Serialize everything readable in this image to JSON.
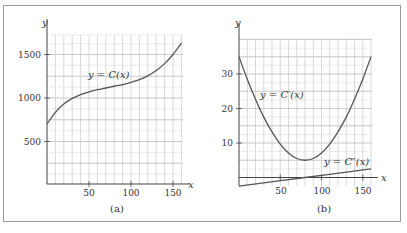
{
  "chart_data": [
    {
      "panel": "(a)",
      "type": "line",
      "title": "",
      "xlabel": "x",
      "ylabel": "y",
      "xlim": [
        0,
        162
      ],
      "ylim": [
        0,
        1750
      ],
      "xticks": [
        50,
        100,
        150
      ],
      "yticks": [
        500,
        1000,
        1500
      ],
      "grid": true,
      "series": [
        {
          "name": "y = C(x)",
          "x": [
            0,
            10,
            20,
            30,
            40,
            50,
            60,
            70,
            80,
            90,
            100,
            110,
            120,
            130,
            140,
            150,
            160
          ],
          "values": [
            700,
            835,
            930,
            995,
            1040,
            1070,
            1095,
            1115,
            1135,
            1155,
            1180,
            1210,
            1255,
            1315,
            1395,
            1500,
            1630
          ]
        }
      ],
      "annotations": [
        {
          "text": "y = C(x)",
          "x": 60,
          "y": 1250
        }
      ]
    },
    {
      "panel": "(b)",
      "type": "line",
      "title": "",
      "xlabel": "x",
      "ylabel": "y",
      "xlim": [
        0,
        162
      ],
      "ylim": [
        -3,
        40
      ],
      "xticks": [
        50,
        100,
        150
      ],
      "yticks": [
        10,
        20,
        30
      ],
      "grid": true,
      "series": [
        {
          "name": "y = C′(x)",
          "x": [
            0,
            10,
            20,
            30,
            40,
            50,
            60,
            70,
            80,
            90,
            100,
            110,
            120,
            130,
            140,
            150,
            160
          ],
          "values": [
            35,
            28.5,
            22.7,
            17.5,
            13.2,
            9.7,
            7.1,
            5.5,
            5.0,
            5.5,
            7.1,
            9.7,
            13.2,
            17.5,
            22.7,
            28.5,
            35
          ]
        },
        {
          "name": "y = C″(x)",
          "x": [
            0,
            80,
            160
          ],
          "values": [
            -2.5,
            0,
            2.5
          ]
        }
      ],
      "annotations": [
        {
          "text": "y = C′(x)",
          "x": 8,
          "y": 23
        },
        {
          "text": "y = C″(x)",
          "x": 105,
          "y": 4
        }
      ]
    }
  ],
  "panels": {
    "a": {
      "label": "(a)",
      "x_var": "x",
      "y_var": "y",
      "curve_label": "y = C(x)",
      "xticks": [
        "50",
        "100",
        "150"
      ],
      "yticks": [
        "500",
        "1000",
        "1500"
      ]
    },
    "b": {
      "label": "(b)",
      "x_var": "x",
      "y_var": "y",
      "curve1_label": "y = C′(x)",
      "curve2_label": "y = C″(x)",
      "xticks": [
        "50",
        "100",
        "150"
      ],
      "yticks": [
        "10",
        "20",
        "30"
      ]
    }
  }
}
